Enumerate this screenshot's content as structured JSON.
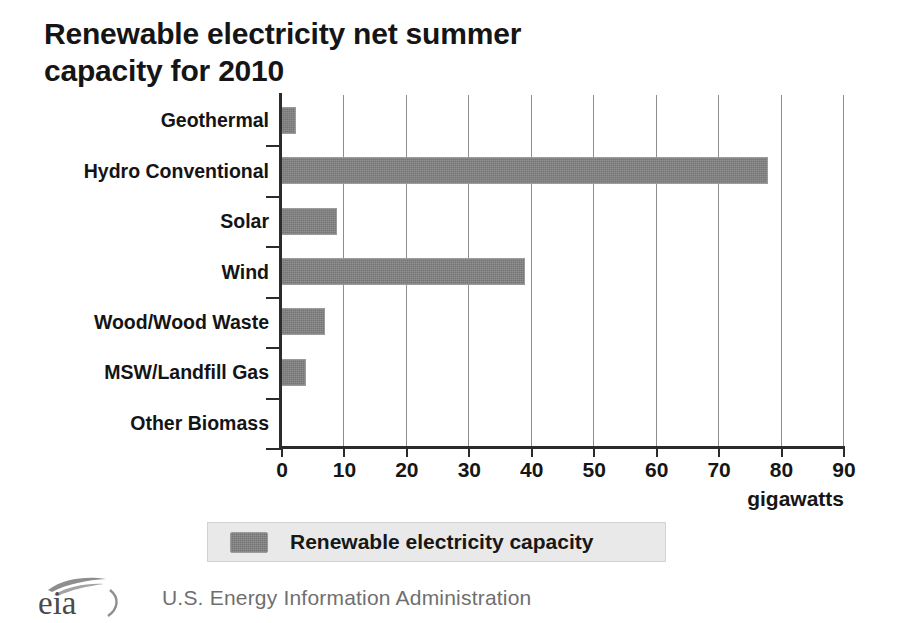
{
  "chart_data": {
    "type": "bar",
    "orientation": "horizontal",
    "title": "Renewable electricity net summer\ncapacity for 2010",
    "categories": [
      "Geothermal",
      "Hydro Conventional",
      "Solar",
      "Wind",
      "Wood/Wood Waste",
      "MSW/Landfill Gas",
      "Other Biomass"
    ],
    "values": [
      2.4,
      78,
      9,
      39,
      7,
      4,
      0
    ],
    "series": [
      {
        "name": "Renewable electricity capacity",
        "values": [
          2.4,
          78,
          9,
          39,
          7,
          4,
          0
        ]
      }
    ],
    "xlabel": "gigawatts",
    "ylabel": "",
    "xlim": [
      0,
      90
    ],
    "xticks": [
      0,
      10,
      20,
      30,
      40,
      50,
      60,
      70,
      80,
      90
    ],
    "xtick_labels": [
      "0",
      "10",
      "20",
      "30",
      "40",
      "50",
      "60",
      "70",
      "80",
      "90"
    ],
    "grid": "vertical",
    "legend_position": "bottom",
    "bar_color": "#757575",
    "gridline_color": "#8d8d8d",
    "axis_color": "#2b2b2b"
  },
  "legend": {
    "entries": [
      {
        "label": "Renewable electricity capacity",
        "color": "#757575"
      }
    ]
  },
  "footer": {
    "logo_text": "eia",
    "agency": "U.S. Energy Information Administration"
  }
}
